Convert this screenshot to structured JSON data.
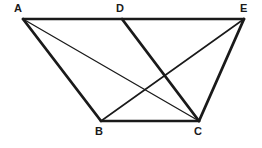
{
  "figure": {
    "background_color": "#ffffff",
    "stroke_color": "#1a1a1a",
    "label_color": "#1a1a1a",
    "canvas": {
      "width": 262,
      "height": 148
    },
    "vertices": [
      {
        "id": "A",
        "label": "A",
        "x": 23,
        "y": 19,
        "label_x": 14,
        "label_y": 3
      },
      {
        "id": "D",
        "label": "D",
        "x": 122,
        "y": 19,
        "label_x": 116,
        "label_y": 3
      },
      {
        "id": "E",
        "label": "E",
        "x": 244,
        "y": 19,
        "label_x": 240,
        "label_y": 3
      },
      {
        "id": "B",
        "label": "B",
        "x": 101,
        "y": 121,
        "label_x": 95,
        "label_y": 126
      },
      {
        "id": "C",
        "label": "C",
        "x": 199,
        "y": 121,
        "label_x": 194,
        "label_y": 126
      }
    ],
    "segments": [
      {
        "id": "AE",
        "from": "A",
        "to": "E",
        "x1": 23,
        "y1": 19,
        "x2": 244,
        "y2": 19,
        "width": 2.6,
        "style": "solid"
      },
      {
        "id": "BC",
        "from": "B",
        "to": "C",
        "x1": 101,
        "y1": 121,
        "x2": 199,
        "y2": 121,
        "width": 2.6,
        "style": "solid"
      },
      {
        "id": "AB",
        "from": "A",
        "to": "B",
        "x1": 23,
        "y1": 19,
        "x2": 101,
        "y2": 121,
        "width": 2.8,
        "style": "solid"
      },
      {
        "id": "CE",
        "from": "C",
        "to": "E",
        "x1": 199,
        "y1": 121,
        "x2": 244,
        "y2": 19,
        "width": 2.8,
        "style": "solid"
      },
      {
        "id": "DC",
        "from": "D",
        "to": "C",
        "x1": 122,
        "y1": 19,
        "x2": 199,
        "y2": 121,
        "width": 2.8,
        "style": "solid"
      },
      {
        "id": "BE",
        "from": "B",
        "to": "E",
        "x1": 101,
        "y1": 121,
        "x2": 244,
        "y2": 19,
        "width": 1.6,
        "style": "solid"
      },
      {
        "id": "AC",
        "from": "A",
        "to": "C",
        "x1": 23,
        "y1": 19,
        "x2": 199,
        "y2": 121,
        "width": 1.3,
        "style": "solid"
      }
    ]
  }
}
